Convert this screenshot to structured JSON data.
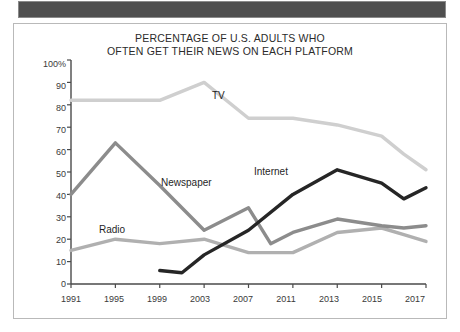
{
  "frame": {
    "top_bar_color": "#4f4f4f",
    "border_color": "#b9b9b9",
    "background": "#ffffff"
  },
  "chart_data": {
    "type": "line",
    "title": "PERCENTAGE OF U.S. ADULTS WHO OFTEN GET THEIR NEWS ON EACH PLATFORM",
    "title_line1": "PERCENTAGE OF U.S. ADULTS WHO",
    "title_line2": "OFTEN GET THEIR NEWS ON EACH PLATFORM",
    "xlabel": "",
    "ylabel": "",
    "ylim": [
      0,
      100
    ],
    "grid": false,
    "legend_position": "inline-annotations",
    "ytick_labels": [
      "100%",
      "90",
      "80",
      "70",
      "60",
      "50",
      "40",
      "30",
      "20",
      "10",
      "0"
    ],
    "ytick_values": [
      100,
      90,
      80,
      70,
      60,
      50,
      40,
      30,
      20,
      10,
      0
    ],
    "xtick_labels": [
      "1991",
      "1995",
      "1999",
      "2003",
      "2007",
      "2011",
      "2013",
      "2015",
      "2017"
    ],
    "xtick_values": [
      1991,
      1995,
      1999,
      2003,
      2007,
      2011,
      2013,
      2015,
      2017
    ],
    "x_axis_note": "uneven spacing: 4-year intervals through 2011, then 2-year intervals",
    "series": [
      {
        "name": "TV",
        "color": "#cfcfcf",
        "x": [
          1991,
          1995,
          1999,
          2003,
          2007,
          2009,
          2011,
          2013,
          2015,
          2016,
          2017
        ],
        "values": [
          82,
          82,
          82,
          90,
          74,
          74,
          74,
          71,
          66,
          58,
          51
        ]
      },
      {
        "name": "Newspaper",
        "color": "#8c8c8c",
        "x": [
          1991,
          1995,
          1999,
          2003,
          2007,
          2009,
          2011,
          2013,
          2015,
          2016,
          2017
        ],
        "values": [
          40,
          63,
          44,
          24,
          34,
          18,
          23,
          29,
          26,
          25,
          26
        ]
      },
      {
        "name": "Radio",
        "color": "#b0b0b0",
        "x": [
          1991,
          1995,
          1999,
          2003,
          2007,
          2009,
          2011,
          2013,
          2015,
          2016,
          2017
        ],
        "values": [
          15,
          20,
          18,
          20,
          14,
          14,
          14,
          23,
          25,
          22,
          19
        ]
      },
      {
        "name": "Internet",
        "color": "#262626",
        "x": [
          1999,
          2001,
          2003,
          2007,
          2011,
          2013,
          2015,
          2016,
          2017
        ],
        "values": [
          6,
          5,
          13,
          24,
          40,
          51,
          45,
          38,
          43
        ]
      }
    ],
    "annotations": [
      {
        "text": "TV",
        "series": "TV"
      },
      {
        "text": "Newspaper",
        "series": "Newspaper"
      },
      {
        "text": "Radio",
        "series": "Radio"
      },
      {
        "text": "Internet",
        "series": "Internet"
      }
    ]
  }
}
